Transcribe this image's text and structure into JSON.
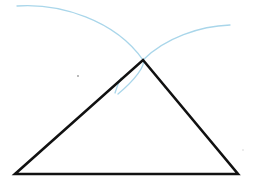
{
  "diagram": {
    "type": "geometric-construction",
    "canvas": {
      "width": 258,
      "height": 185
    },
    "colors": {
      "background": "#ffffff",
      "triangle_stroke": "#111111",
      "arc_stroke": "#a9d6ea",
      "dot": "#9a9a9a"
    },
    "triangle": {
      "vertices": {
        "apex": [
          143,
          60
        ],
        "bottom_left": [
          15,
          174
        ],
        "bottom_right": [
          238,
          174
        ]
      },
      "stroke_width": 2.6
    },
    "arcs": [
      {
        "name": "left-compass-arc",
        "path": "M17 6 C 60 3, 115 20, 143 60 C 146 65, 135 80, 118 94"
      },
      {
        "name": "right-compass-arc",
        "path": "M143 60 C 165 38, 200 26, 230 25"
      },
      {
        "name": "left-side-tick-arc",
        "path": "M121 78 Q 117 86 115 93"
      },
      {
        "name": "right-side-tick-arc",
        "path": "M160 80 Q 163 84 165 88"
      }
    ],
    "stray_marks": [
      {
        "name": "stray-dot",
        "at": [
          78,
          76
        ]
      },
      {
        "name": "stray-dot-right",
        "at": [
          243,
          150
        ]
      }
    ]
  }
}
